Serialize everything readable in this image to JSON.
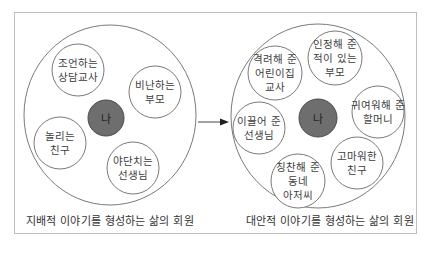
{
  "colors": {
    "frame_border": "#bdbdbd",
    "circle_stroke": "#7a7a7a",
    "me_fill": "#6e6e6e",
    "me_stroke": "#4a4a4a",
    "arrow": "#333333",
    "text": "#3d3d3d"
  },
  "left_diagram": {
    "caption": "지배적 이야기를 형성하는 삶의 회원",
    "center_label": "나",
    "members": [
      {
        "lines": [
          "조언하는",
          "상담교사"
        ]
      },
      {
        "lines": [
          "비난하는",
          "부모"
        ]
      },
      {
        "lines": [
          "놀리는",
          "친구"
        ]
      },
      {
        "lines": [
          "야단치는",
          "선생님"
        ]
      }
    ]
  },
  "arrow": {
    "icon": "arrow-right-icon"
  },
  "right_diagram": {
    "caption": "대안적 이야기를 형성하는 삶의 회원",
    "center_label": "나",
    "members": [
      {
        "lines": [
          "격려해 준",
          "어린이집",
          "교사"
        ]
      },
      {
        "lines": [
          "인정해 준",
          "적이 있는",
          "부모"
        ]
      },
      {
        "lines": [
          "귀여워해 준",
          "할머니"
        ]
      },
      {
        "lines": [
          "이끌어 준",
          "선생님"
        ]
      },
      {
        "lines": [
          "칭찬해 준",
          "동네",
          "아저씨"
        ]
      },
      {
        "lines": [
          "고마워한",
          "친구"
        ]
      }
    ]
  }
}
